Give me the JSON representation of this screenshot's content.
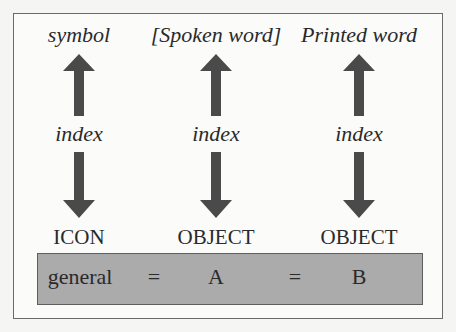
{
  "diagram": {
    "columns": [
      {
        "top": "symbol",
        "middle": "index",
        "bottom": "ICON",
        "x": 79
      },
      {
        "top": "[Spoken word]",
        "middle": "index",
        "bottom": "OBJECT",
        "x": 216
      },
      {
        "top": "Printed word",
        "middle": "index",
        "bottom": "OBJECT",
        "x": 359
      }
    ],
    "equation": {
      "term": "general",
      "eq1": "=",
      "a": "A",
      "eq2": "=",
      "b": "B"
    },
    "colors": {
      "arrow": "#4a4a4a",
      "box_fill": "#ababab",
      "box_border": "#5e5e5e",
      "frame_border": "#6a6a6a"
    }
  }
}
